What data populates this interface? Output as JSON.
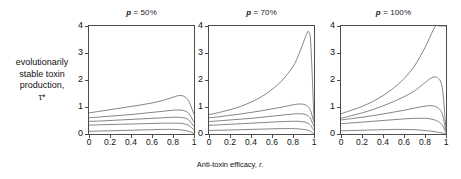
{
  "figure": {
    "y_axis_label": "evolutionarily stable toxin production, τ*",
    "y_axis_label_lines": [
      "evolutionarily",
      "stable toxin",
      "production,",
      "τ*"
    ],
    "x_axis_label_prefix": "Anti-toxin efficacy, ",
    "x_axis_label_var": "r."
  },
  "chart_data": {
    "type": "line",
    "title": "",
    "xlabel": "Anti-toxin efficacy, r.",
    "ylabel": "evolutionarily stable toxin production, τ*",
    "xlim": [
      0,
      1
    ],
    "ylim": [
      0,
      4
    ],
    "xticks": [
      0,
      0.2,
      0.4,
      0.6,
      0.8,
      1
    ],
    "xtick_labels": [
      "0",
      "0.2",
      "0.4",
      "0.6",
      "0.8",
      "1"
    ],
    "yticks": [
      0,
      1,
      2,
      3,
      4
    ],
    "ytick_labels": [
      "0",
      "1",
      "2",
      "3",
      "4"
    ],
    "grid": false,
    "legend": "none",
    "line_color": "#666666",
    "panels": [
      {
        "id": "panel-p50",
        "title_prefix": "p",
        "title_rest": " = 50%",
        "title": "p = 50%",
        "x": [
          0,
          0.1,
          0.2,
          0.3,
          0.4,
          0.5,
          0.6,
          0.7,
          0.8,
          0.85,
          0.9,
          0.95,
          1.0
        ],
        "series": [
          {
            "name": "curve-1",
            "values": [
              0.78,
              0.84,
              0.9,
              0.96,
              1.02,
              1.08,
              1.15,
              1.24,
              1.36,
              1.42,
              1.4,
              1.22,
              0.72
            ]
          },
          {
            "name": "curve-2",
            "values": [
              0.6,
              0.63,
              0.66,
              0.69,
              0.72,
              0.76,
              0.8,
              0.84,
              0.88,
              0.89,
              0.87,
              0.76,
              0.44
            ]
          },
          {
            "name": "curve-3",
            "values": [
              0.47,
              0.48,
              0.5,
              0.52,
              0.54,
              0.56,
              0.58,
              0.6,
              0.62,
              0.62,
              0.6,
              0.52,
              0.28
            ]
          },
          {
            "name": "curve-4",
            "values": [
              0.33,
              0.34,
              0.35,
              0.36,
              0.37,
              0.38,
              0.39,
              0.4,
              0.4,
              0.4,
              0.38,
              0.32,
              0.15
            ]
          },
          {
            "name": "curve-5",
            "values": [
              0.1,
              0.11,
              0.12,
              0.13,
              0.14,
              0.15,
              0.16,
              0.17,
              0.17,
              0.16,
              0.14,
              0.1,
              0.02
            ]
          }
        ]
      },
      {
        "id": "panel-p70",
        "title_prefix": "p",
        "title_rest": " = 70%",
        "title": "p = 70%",
        "x": [
          0,
          0.1,
          0.2,
          0.3,
          0.4,
          0.5,
          0.6,
          0.7,
          0.8,
          0.85,
          0.9,
          0.93,
          0.95,
          0.97,
          1.0
        ],
        "series": [
          {
            "name": "curve-1",
            "values": [
              0.72,
              0.8,
              0.9,
              1.02,
              1.18,
              1.38,
              1.65,
              2.0,
              2.5,
              2.9,
              3.4,
              3.7,
              3.78,
              3.3,
              0.5
            ]
          },
          {
            "name": "curve-2",
            "values": [
              0.6,
              0.64,
              0.69,
              0.74,
              0.8,
              0.86,
              0.93,
              1.0,
              1.08,
              1.11,
              1.1,
              1.05,
              0.98,
              0.84,
              0.42
            ]
          },
          {
            "name": "curve-3",
            "values": [
              0.46,
              0.49,
              0.52,
              0.55,
              0.58,
              0.62,
              0.66,
              0.7,
              0.74,
              0.75,
              0.74,
              0.7,
              0.65,
              0.55,
              0.27
            ]
          },
          {
            "name": "curve-4",
            "values": [
              0.32,
              0.34,
              0.36,
              0.38,
              0.4,
              0.42,
              0.44,
              0.46,
              0.47,
              0.47,
              0.45,
              0.42,
              0.38,
              0.31,
              0.13
            ]
          },
          {
            "name": "curve-5",
            "values": [
              0.13,
              0.14,
              0.15,
              0.16,
              0.17,
              0.18,
              0.19,
              0.2,
              0.2,
              0.19,
              0.17,
              0.15,
              0.13,
              0.09,
              0.01
            ]
          }
        ]
      },
      {
        "id": "panel-p100",
        "title_prefix": "p",
        "title_rest": " = 100%",
        "title": "p = 100%",
        "x": [
          0,
          0.1,
          0.2,
          0.3,
          0.4,
          0.5,
          0.6,
          0.7,
          0.8,
          0.85,
          0.9,
          0.93,
          0.95,
          0.97,
          1.0
        ],
        "series": [
          {
            "name": "curve-1",
            "values": [
              0.75,
              0.88,
              1.02,
              1.2,
              1.42,
              1.7,
              2.05,
              2.52,
              3.2,
              3.62,
              4.0,
              4.0,
              4.0,
              4.0,
              4.0
            ]
          },
          {
            "name": "curve-2",
            "values": [
              0.58,
              0.68,
              0.78,
              0.9,
              1.04,
              1.2,
              1.38,
              1.6,
              1.9,
              2.05,
              2.12,
              2.05,
              1.92,
              1.55,
              0.18
            ]
          },
          {
            "name": "curve-3",
            "values": [
              0.52,
              0.57,
              0.62,
              0.68,
              0.74,
              0.81,
              0.88,
              0.96,
              1.03,
              1.05,
              1.02,
              0.95,
              0.86,
              0.68,
              0.08
            ]
          },
          {
            "name": "curve-4",
            "values": [
              0.38,
              0.41,
              0.44,
              0.47,
              0.5,
              0.53,
              0.56,
              0.58,
              0.58,
              0.56,
              0.51,
              0.45,
              0.39,
              0.29,
              0.04
            ]
          },
          {
            "name": "curve-5",
            "values": [
              0.12,
              0.13,
              0.14,
              0.15,
              0.16,
              0.17,
              0.17,
              0.16,
              0.13,
              0.11,
              0.08,
              0.06,
              0.05,
              0.03,
              0.01
            ]
          }
        ]
      }
    ]
  }
}
